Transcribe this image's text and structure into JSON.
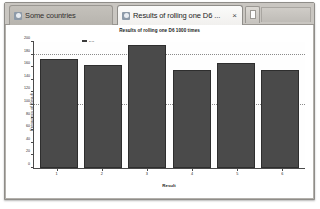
{
  "window": {
    "new_tab_label": "+",
    "new_tab_icon": "page-icon"
  },
  "tabs": [
    {
      "label": "Some countries",
      "favicon": "globe-icon",
      "active": false
    },
    {
      "label": "Results of rolling one D6 ...",
      "favicon": "globe-icon",
      "close_label": "×",
      "active": true
    }
  ],
  "chart_data": {
    "type": "bar",
    "title": "Results of rolling one D6 1000 times",
    "xlabel": "Result",
    "ylabel": "Frequency of Result",
    "categories": [
      "1",
      "2",
      "3",
      "4",
      "5",
      "6"
    ],
    "values": [
      173,
      163,
      196,
      155,
      167,
      155
    ],
    "ylim": [
      0,
      200
    ],
    "yticks": [
      0,
      20,
      40,
      60,
      80,
      100,
      120,
      140,
      160,
      180,
      200
    ],
    "gridlines": [
      100,
      180
    ],
    "grid": true,
    "legend": [
      {
        "name": "D6",
        "color": "#4a4a4a"
      }
    ],
    "legend_position": "top-left",
    "bar_color": "#4a4a4a",
    "bar_border_color": "#2e2e2e"
  },
  "colors": {
    "window_chrome": "#d6d3ce",
    "tab_bar": "#c9c6c1",
    "active_tab": "#fbfbfa",
    "inactive_tab": "#c4c1bb",
    "plot_background": "#fefefe",
    "axis": "#4a4a4a",
    "gridline": "#8a8a8a"
  }
}
